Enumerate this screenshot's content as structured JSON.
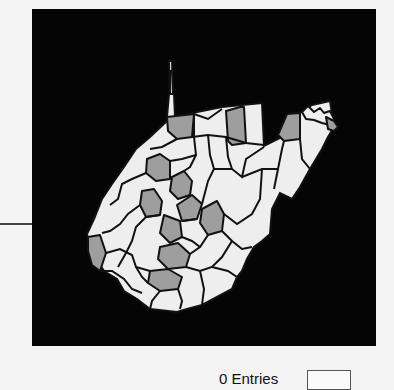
{
  "map": {
    "region": "West Virginia",
    "subdivision": "counties",
    "background_color": "#050505",
    "colors": {
      "highlighted": "#9e9e9e",
      "default": "#eeeeee",
      "border": "#111111"
    }
  },
  "legend": {
    "label": "0 Entries",
    "swatch_color": "#fafafa"
  }
}
